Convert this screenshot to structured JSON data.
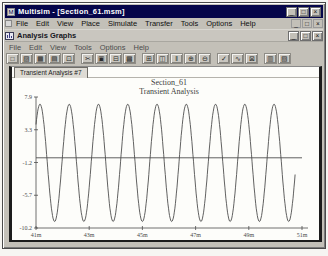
{
  "window": {
    "title": "Multisim - [Section_61.msm]",
    "menu": [
      "File",
      "Edit",
      "View",
      "Place",
      "Simulate",
      "Transfer",
      "Tools",
      "Options",
      "Help"
    ]
  },
  "window_controls": [
    {
      "name": "minimize",
      "glyph": "_"
    },
    {
      "name": "maximize",
      "glyph": "□"
    },
    {
      "name": "close",
      "glyph": "×"
    }
  ],
  "analysis_window": {
    "title": "Analysis Graphs",
    "menu": [
      "File",
      "Edit",
      "View",
      "Tools",
      "Options",
      "Help"
    ],
    "tab": "Transient Analysis #7"
  },
  "toolbar": {
    "groups": [
      [
        {
          "name": "new",
          "glyph": "□"
        },
        {
          "name": "open",
          "glyph": "▨"
        },
        {
          "name": "save",
          "glyph": "▦"
        },
        {
          "name": "print",
          "glyph": "▤"
        },
        {
          "name": "print-preview",
          "glyph": "⊡"
        }
      ],
      [
        {
          "name": "cut",
          "glyph": "✂"
        },
        {
          "name": "copy",
          "glyph": "▣"
        },
        {
          "name": "paste",
          "glyph": "⊟"
        },
        {
          "name": "properties",
          "glyph": "▩"
        }
      ],
      [
        {
          "name": "toggle-grid",
          "glyph": "⊞"
        },
        {
          "name": "toggle-legend",
          "glyph": "◫"
        },
        {
          "name": "show-cursors",
          "glyph": "‖"
        },
        {
          "name": "zoom-in",
          "glyph": "⊕"
        },
        {
          "name": "zoom-out",
          "glyph": "⊖"
        }
      ],
      [
        {
          "name": "analysis-ok",
          "glyph": "✓"
        },
        {
          "name": "trace-style",
          "glyph": "∿"
        },
        {
          "name": "axes-settings",
          "glyph": "⊠"
        }
      ],
      [
        {
          "name": "page-setup",
          "glyph": "▥"
        },
        {
          "name": "export-data",
          "glyph": "▧"
        }
      ]
    ]
  },
  "chart_data": {
    "type": "line",
    "title": "Section_61",
    "subtitle": "Transient Analysis",
    "xlabel": "",
    "ylabel": "",
    "x_unit": "ms",
    "x_ticks": [
      "41m",
      "43m",
      "45m",
      "47m",
      "49m",
      "51m"
    ],
    "x_range_ms": [
      41,
      51
    ],
    "y_ticks": [
      "7.9",
      "3.3",
      "-1.2",
      "-5.7",
      "-10.2"
    ],
    "ylim": [
      -10.2,
      7.9
    ],
    "grid": false,
    "legend": "none",
    "axis_color": "#4d4d4d",
    "series": [
      {
        "name": "output-sine",
        "shape": "sine",
        "amplitude_v": 8.1,
        "offset_v": -1.2,
        "period_ms": 1.1,
        "peak_at_ms": 41.15,
        "t_start_ms": 41.0,
        "t_end_ms": 50.75,
        "color": "#4f4f4f"
      },
      {
        "name": "input-flat",
        "shape": "constant",
        "value_v": -0.5,
        "t_start_ms": 41.0,
        "t_end_ms": 51.0,
        "color": "#4f4f4f"
      }
    ]
  }
}
